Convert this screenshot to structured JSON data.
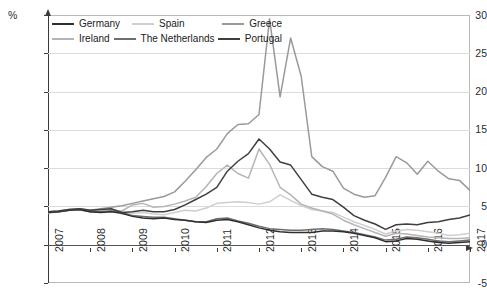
{
  "axis": {
    "unit_label": "%",
    "y_ticks": [
      30,
      25,
      20,
      15,
      10,
      5,
      0,
      -5
    ],
    "x_ticks": [
      "2007",
      "2008",
      "2009",
      "2010",
      "2011",
      "2012",
      "2013",
      "2014",
      "2015",
      "2016",
      "2017"
    ]
  },
  "legend": {
    "row1": [
      {
        "label": "Germany",
        "color": "#2f2f2f"
      },
      {
        "label": "Spain",
        "color": "#cfcfcf"
      },
      {
        "label": "Greece",
        "color": "#9a9a9a"
      }
    ],
    "row2": [
      {
        "label": "Ireland",
        "color": "#b5b5b5"
      },
      {
        "label": "The Netherlands",
        "color": "#6e6e6e"
      },
      {
        "label": "Portugal",
        "color": "#3f3f3f"
      }
    ]
  },
  "chart_data": {
    "type": "line",
    "title": "",
    "xlabel": "",
    "ylabel": "%",
    "xlim": [
      2007,
      2017
    ],
    "ylim": [
      -5,
      30
    ],
    "ytick_step": 5,
    "grid": true,
    "legend_position": "top-left-inside",
    "x": [
      2007.0,
      2007.25,
      2007.5,
      2007.75,
      2008.0,
      2008.25,
      2008.5,
      2008.75,
      2009.0,
      2009.25,
      2009.5,
      2009.75,
      2010.0,
      2010.25,
      2010.5,
      2010.75,
      2011.0,
      2011.25,
      2011.5,
      2011.75,
      2012.0,
      2012.25,
      2012.5,
      2012.75,
      2013.0,
      2013.25,
      2013.5,
      2013.75,
      2014.0,
      2014.25,
      2014.5,
      2014.75,
      2015.0,
      2015.25,
      2015.5,
      2015.75,
      2016.0,
      2016.25,
      2016.5,
      2016.75,
      2017.0
    ],
    "series": [
      {
        "name": "Germany",
        "color": "#2f2f2f",
        "values": [
          4.2,
          4.3,
          4.5,
          4.6,
          4.3,
          4.2,
          4.3,
          4.1,
          3.7,
          3.5,
          3.4,
          3.5,
          3.3,
          3.2,
          3.0,
          2.9,
          3.2,
          3.3,
          3.0,
          2.6,
          2.2,
          1.9,
          1.7,
          1.6,
          1.6,
          1.6,
          1.8,
          1.8,
          1.7,
          1.5,
          1.2,
          0.9,
          0.4,
          0.5,
          0.8,
          0.7,
          0.5,
          0.3,
          0.2,
          0.3,
          0.4
        ]
      },
      {
        "name": "Spain",
        "color": "#cfcfcf",
        "values": [
          4.1,
          4.3,
          4.6,
          4.5,
          4.3,
          4.5,
          4.6,
          4.0,
          4.1,
          4.2,
          4.0,
          3.9,
          4.2,
          4.5,
          4.4,
          4.8,
          5.4,
          5.5,
          5.6,
          5.5,
          5.3,
          5.6,
          6.5,
          5.8,
          5.1,
          4.6,
          4.4,
          4.2,
          3.6,
          3.0,
          2.5,
          2.0,
          1.4,
          1.8,
          2.0,
          1.9,
          1.7,
          1.5,
          1.2,
          1.3,
          1.5
        ]
      },
      {
        "name": "Greece",
        "color": "#9a9a9a",
        "values": [
          4.3,
          4.4,
          4.6,
          4.7,
          4.5,
          4.7,
          4.9,
          5.1,
          5.4,
          5.7,
          6.0,
          6.3,
          6.9,
          8.3,
          9.8,
          11.4,
          12.5,
          14.5,
          15.7,
          15.8,
          17.0,
          29.5,
          19.3,
          27.0,
          22.0,
          11.5,
          10.2,
          9.6,
          7.4,
          6.6,
          6.2,
          6.4,
          8.8,
          11.5,
          10.7,
          9.2,
          10.9,
          9.6,
          8.6,
          8.4,
          7.1
        ]
      },
      {
        "name": "Ireland",
        "color": "#b5b5b5",
        "values": [
          4.2,
          4.3,
          4.5,
          4.6,
          4.4,
          4.6,
          4.5,
          4.4,
          5.2,
          5.4,
          4.9,
          5.0,
          5.3,
          5.7,
          6.2,
          7.6,
          9.3,
          10.4,
          9.3,
          8.7,
          12.5,
          10.5,
          7.5,
          6.5,
          5.3,
          4.8,
          4.4,
          4.0,
          3.2,
          2.6,
          2.1,
          1.6,
          1.1,
          1.5,
          1.4,
          1.2,
          1.0,
          0.9,
          0.8,
          0.8,
          0.9
        ]
      },
      {
        "name": "The Netherlands",
        "color": "#6e6e6e",
        "values": [
          4.2,
          4.3,
          4.5,
          4.6,
          4.3,
          4.3,
          4.4,
          4.2,
          3.8,
          3.7,
          3.6,
          3.6,
          3.4,
          3.2,
          3.0,
          3.0,
          3.4,
          3.5,
          3.1,
          2.8,
          2.4,
          2.1,
          2.0,
          1.9,
          1.9,
          2.0,
          2.1,
          2.0,
          1.8,
          1.6,
          1.3,
          1.0,
          0.6,
          0.7,
          1.0,
          0.9,
          0.7,
          0.5,
          0.4,
          0.5,
          0.6
        ]
      },
      {
        "name": "Portugal",
        "color": "#3f3f3f",
        "values": [
          4.3,
          4.4,
          4.6,
          4.7,
          4.5,
          4.6,
          4.7,
          4.2,
          4.3,
          4.5,
          4.3,
          4.3,
          4.6,
          5.2,
          5.9,
          6.6,
          7.5,
          9.6,
          10.9,
          11.9,
          13.8,
          12.5,
          10.8,
          10.4,
          8.5,
          6.6,
          6.2,
          5.9,
          4.9,
          3.8,
          3.2,
          2.7,
          2.0,
          2.6,
          2.7,
          2.6,
          2.9,
          3.0,
          3.3,
          3.5,
          3.9
        ]
      }
    ]
  }
}
